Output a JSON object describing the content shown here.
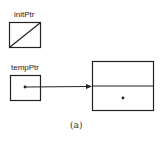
{
  "diagram": {
    "type": "pointer-diagram",
    "nodes": [
      {
        "id": "initPtr",
        "label": "initPtr",
        "kind": "pointer-variable",
        "value": "null"
      },
      {
        "id": "tempPtr",
        "label": "tempPtr",
        "kind": "pointer-variable",
        "value": "points-to-node"
      },
      {
        "id": "node",
        "label": "",
        "kind": "list-node",
        "fields": [
          "info",
          "next"
        ],
        "next_value": "dot"
      }
    ],
    "edges": [
      {
        "from": "tempPtr",
        "to": "node",
        "style": "arrow"
      }
    ],
    "caption": "(a)"
  },
  "colors": {
    "stroke": "#222222",
    "background": "#ffffff"
  }
}
